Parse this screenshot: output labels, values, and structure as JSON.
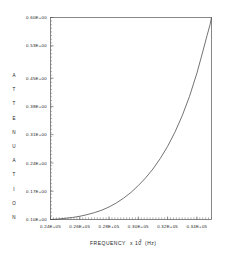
{
  "chart_data": {
    "type": "line",
    "title": "",
    "xlabel": "FREQUENCY  x 10^3  (Hz)",
    "xlabel_main": "FREQUENCY",
    "xlabel_mult": "x 10",
    "xlabel_exp": "3",
    "xlabel_unit": "(Hz)",
    "ylabel": "ATTENUATION",
    "ylabel_letters": [
      "A",
      "T",
      "T",
      "E",
      "N",
      "U",
      "A",
      "T",
      "I",
      "O",
      "N"
    ],
    "xlim": [
      24000,
      35000
    ],
    "ylim": [
      0.1,
      0.6
    ],
    "grid": false,
    "legend": null,
    "xticks": [
      24000,
      26000,
      28000,
      30000,
      32000,
      34000
    ],
    "xtick_labels": [
      "0.24E+05",
      "0.26E+05",
      "0.28E+05",
      "0.30E+05",
      "0.32E+05",
      "0.34E+05"
    ],
    "yticks": [
      0.1,
      0.17,
      0.24,
      0.31,
      0.38,
      0.45,
      0.53,
      0.6
    ],
    "ytick_labels": [
      "0.10E+00",
      "0.17E+00",
      "0.24E+00",
      "0.31E+00",
      "0.38E+00",
      "0.45E+00",
      "0.53E+00",
      "0.60E+00"
    ],
    "x": [
      24000,
      24500,
      25000,
      25500,
      26000,
      26500,
      27000,
      27500,
      28000,
      28500,
      29000,
      29500,
      30000,
      30500,
      31000,
      31500,
      32000,
      32500,
      33000,
      33500,
      34000,
      34400,
      34700,
      34900,
      35000
    ],
    "values": [
      0.1,
      0.101,
      0.103,
      0.105,
      0.108,
      0.112,
      0.117,
      0.123,
      0.131,
      0.141,
      0.153,
      0.167,
      0.184,
      0.203,
      0.225,
      0.251,
      0.281,
      0.316,
      0.357,
      0.405,
      0.462,
      0.515,
      0.556,
      0.582,
      0.6
    ],
    "series": [
      {
        "name": "attenuation",
        "color": "#444444",
        "values": [
          0.1,
          0.101,
          0.103,
          0.105,
          0.108,
          0.112,
          0.117,
          0.123,
          0.131,
          0.141,
          0.153,
          0.167,
          0.184,
          0.203,
          0.225,
          0.251,
          0.281,
          0.316,
          0.357,
          0.405,
          0.462,
          0.515,
          0.556,
          0.582,
          0.6
        ]
      }
    ],
    "x_minor_tick_count": 55,
    "y_minor_tick_count": 56,
    "frame_color": "#555555"
  }
}
